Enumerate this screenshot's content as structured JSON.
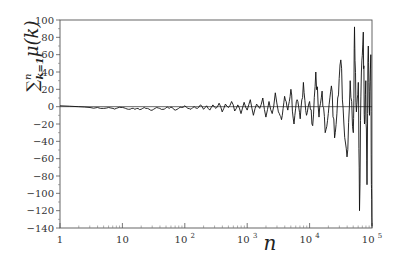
{
  "chart_data": {
    "type": "line",
    "title": "",
    "xlabel": "n",
    "ylabel": "∑_{k=1}^{n} μ(k)",
    "x_scale": "log",
    "xlim": [
      1,
      100000
    ],
    "ylim": [
      -140,
      100
    ],
    "grid": false,
    "legend": null,
    "x_ticks": [
      {
        "value": 1,
        "label": "1"
      },
      {
        "value": 10,
        "label": "10"
      },
      {
        "value": 100,
        "label": "10²"
      },
      {
        "value": 1000,
        "label": "10³"
      },
      {
        "value": 10000,
        "label": "10⁴"
      },
      {
        "value": 100000,
        "label": "10⁵"
      }
    ],
    "y_ticks": [
      100,
      80,
      60,
      40,
      20,
      0,
      -20,
      -40,
      -60,
      -80,
      -100,
      -120,
      -140
    ],
    "reference_line": {
      "y": 0
    },
    "series": [
      {
        "name": "Mertens function M(n)",
        "points_log10n_value": [
          [
            0.0,
            1
          ],
          [
            0.3,
            0
          ],
          [
            0.48,
            -1
          ],
          [
            0.6,
            -1
          ],
          [
            0.7,
            -2
          ],
          [
            0.78,
            -1
          ],
          [
            0.85,
            -2
          ],
          [
            0.9,
            -2
          ],
          [
            1.0,
            -1
          ],
          [
            1.05,
            -2
          ],
          [
            1.1,
            -3
          ],
          [
            1.15,
            -2
          ],
          [
            1.2,
            -3
          ],
          [
            1.25,
            -2
          ],
          [
            1.3,
            -3
          ],
          [
            1.35,
            -1
          ],
          [
            1.4,
            -2
          ],
          [
            1.45,
            -4
          ],
          [
            1.5,
            -3
          ],
          [
            1.55,
            -1
          ],
          [
            1.6,
            -2
          ],
          [
            1.65,
            -3
          ],
          [
            1.7,
            -1
          ],
          [
            1.75,
            -2
          ],
          [
            1.8,
            -1
          ],
          [
            1.85,
            -4
          ],
          [
            1.9,
            -2
          ],
          [
            1.95,
            -1
          ],
          [
            2.0,
            1
          ],
          [
            2.05,
            -2
          ],
          [
            2.1,
            -3
          ],
          [
            2.15,
            0
          ],
          [
            2.2,
            -2
          ],
          [
            2.25,
            2
          ],
          [
            2.3,
            -3
          ],
          [
            2.35,
            1
          ],
          [
            2.4,
            -4
          ],
          [
            2.45,
            2
          ],
          [
            2.5,
            -2
          ],
          [
            2.55,
            4
          ],
          [
            2.6,
            -6
          ],
          [
            2.65,
            3
          ],
          [
            2.7,
            -1
          ],
          [
            2.75,
            6
          ],
          [
            2.8,
            -5
          ],
          [
            2.85,
            2
          ],
          [
            2.9,
            -8
          ],
          [
            2.95,
            5
          ],
          [
            3.0,
            -4
          ],
          [
            3.05,
            8
          ],
          [
            3.1,
            -10
          ],
          [
            3.15,
            3
          ],
          [
            3.2,
            -2
          ],
          [
            3.25,
            10
          ],
          [
            3.3,
            -12
          ],
          [
            3.35,
            6
          ],
          [
            3.4,
            -8
          ],
          [
            3.45,
            16
          ],
          [
            3.5,
            -6
          ],
          [
            3.55,
            -15
          ],
          [
            3.6,
            12
          ],
          [
            3.65,
            -4
          ],
          [
            3.7,
            20
          ],
          [
            3.75,
            -20
          ],
          [
            3.8,
            8
          ],
          [
            3.85,
            -14
          ],
          [
            3.9,
            28
          ],
          [
            3.95,
            -10
          ],
          [
            4.0,
            6
          ],
          [
            4.05,
            -22
          ],
          [
            4.1,
            40
          ],
          [
            4.15,
            -12
          ],
          [
            4.2,
            18
          ],
          [
            4.25,
            -30
          ],
          [
            4.3,
            -8
          ],
          [
            4.35,
            24
          ],
          [
            4.4,
            -36
          ],
          [
            4.45,
            10
          ],
          [
            4.5,
            54
          ],
          [
            4.55,
            -20
          ],
          [
            4.6,
            -58
          ],
          [
            4.65,
            30
          ],
          [
            4.7,
            -30
          ],
          [
            4.72,
            92
          ],
          [
            4.75,
            -6
          ],
          [
            4.78,
            28
          ],
          [
            4.8,
            -120
          ],
          [
            4.83,
            40
          ],
          [
            4.86,
            86
          ],
          [
            4.88,
            -20
          ],
          [
            4.9,
            30
          ],
          [
            4.92,
            -90
          ],
          [
            4.94,
            70
          ],
          [
            4.96,
            -10
          ],
          [
            4.98,
            60
          ],
          [
            4.99,
            -90
          ],
          [
            5.0,
            -138
          ]
        ]
      }
    ]
  }
}
